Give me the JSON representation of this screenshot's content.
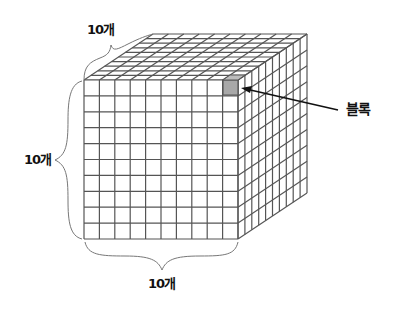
{
  "diagram": {
    "title": "",
    "labels": {
      "top_count": "10개",
      "left_count": "10개",
      "bottom_count": "10개",
      "block": "블록"
    },
    "grid": {
      "rows": 10,
      "cols": 10,
      "depth": 10
    },
    "colors": {
      "grid_line": "#555555",
      "block_fill": "#a8a8a8",
      "brace": "#777777",
      "arrow": "#111111",
      "text": "#111111"
    }
  }
}
